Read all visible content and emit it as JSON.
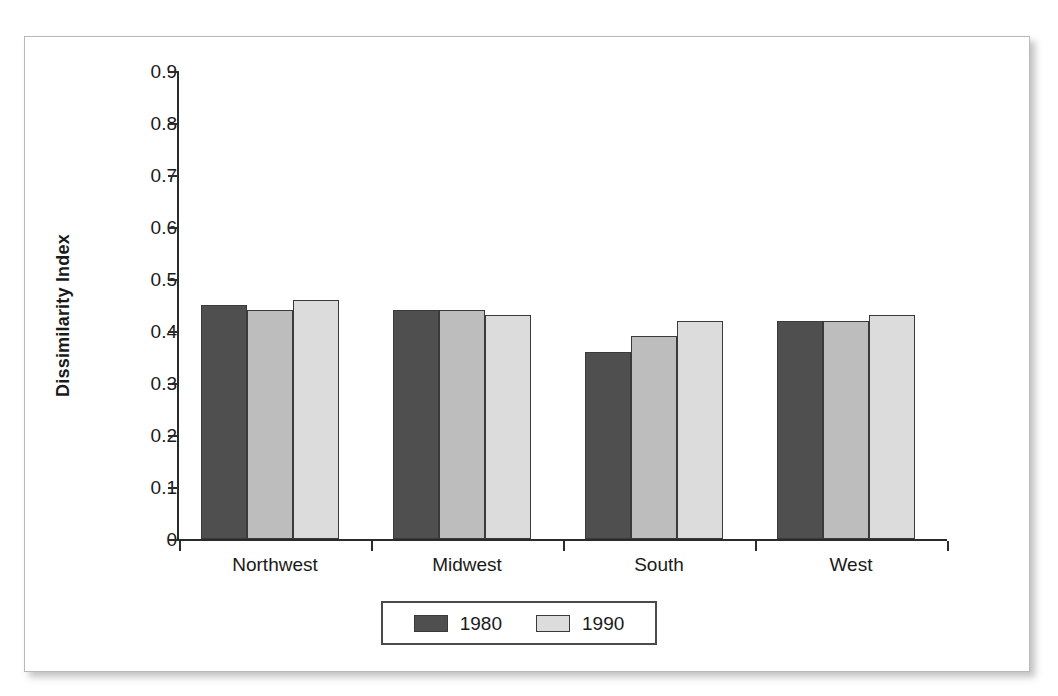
{
  "chart_data": {
    "type": "bar",
    "title": "",
    "xlabel": "",
    "ylabel": "Dissimilarity Index",
    "categories": [
      "Northwest",
      "Midwest",
      "South",
      "West"
    ],
    "series": [
      {
        "name": "1980",
        "color": "#4f4f4f",
        "values": [
          0.45,
          0.44,
          0.36,
          0.42
        ]
      },
      {
        "name": "",
        "color": "#bdbdbd",
        "values": [
          0.44,
          0.44,
          0.39,
          0.42
        ]
      },
      {
        "name": "1990",
        "color": "#dcdcdc",
        "values": [
          0.46,
          0.43,
          0.42,
          0.43
        ]
      }
    ],
    "ylim": [
      0,
      0.9
    ],
    "ytick_labels": [
      "0.9",
      "0.8",
      "0.7",
      "0.6",
      "0.5",
      "0.4",
      "0.3",
      "0.2",
      "0.1",
      "0"
    ],
    "ytick_values": [
      0.9,
      0.8,
      0.7,
      0.6,
      0.5,
      0.4,
      0.3,
      0.2,
      0.1,
      0
    ],
    "grid": false,
    "legend_position": "bottom-center",
    "legend_entries": [
      {
        "label": "1980",
        "color": "#4f4f4f"
      },
      {
        "label": "1990",
        "color": "#dcdcdc"
      }
    ]
  }
}
